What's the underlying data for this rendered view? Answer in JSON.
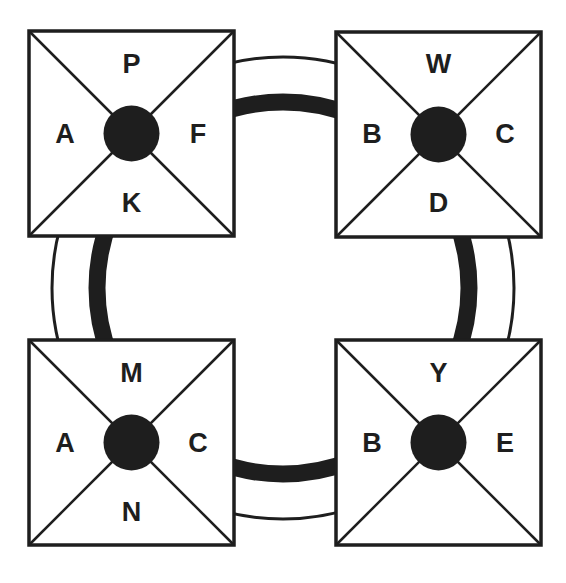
{
  "diagram": {
    "colors": {
      "stroke": "#1e1e1e",
      "fill": "#ffffff",
      "hub": "#1e1e1e"
    },
    "ring": {
      "cx": 283,
      "cy": 288,
      "outer_r": 231,
      "inner_r": 186,
      "inner_width": 17
    },
    "boxes": [
      {
        "id": "top-left",
        "x": 29,
        "y": 31,
        "size": 205,
        "labels": {
          "top": "P",
          "left": "A",
          "right": "F",
          "bottom": "K"
        }
      },
      {
        "id": "top-right",
        "x": 336,
        "y": 32,
        "size": 205,
        "labels": {
          "top": "W",
          "left": "B",
          "right": "C",
          "bottom": "D"
        }
      },
      {
        "id": "bottom-left",
        "x": 29,
        "y": 340,
        "size": 205,
        "labels": {
          "top": "M",
          "left": "A",
          "right": "C",
          "bottom": "N"
        }
      },
      {
        "id": "bottom-right",
        "x": 336,
        "y": 340,
        "size": 205,
        "labels": {
          "top": "Y",
          "left": "B",
          "right": "E",
          "bottom": ""
        }
      }
    ]
  }
}
